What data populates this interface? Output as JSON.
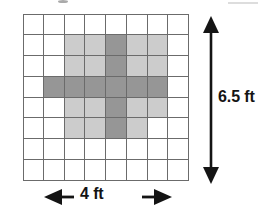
{
  "figure": {
    "title": "",
    "type": "shaded-grid-area-diagram"
  },
  "grid": {
    "columns": 8,
    "rows": 8,
    "line_color": "#6b6b6b",
    "background_color": "#ffffff",
    "shade_colors": {
      "none": "#ffffff",
      "light": "#cccccc",
      "dark": "#969696"
    },
    "legend": {
      "none_label": "unshaded",
      "light_label": "light shaded",
      "dark_label": "dark shaded"
    },
    "cells": [
      [
        "none",
        "none",
        "none",
        "none",
        "none",
        "none",
        "none",
        "none"
      ],
      [
        "none",
        "none",
        "light",
        "light",
        "dark",
        "light",
        "light",
        "none"
      ],
      [
        "none",
        "none",
        "light",
        "light",
        "dark",
        "light",
        "light",
        "none"
      ],
      [
        "none",
        "dark",
        "dark",
        "dark",
        "dark",
        "dark",
        "dark",
        "none"
      ],
      [
        "none",
        "none",
        "light",
        "light",
        "dark",
        "light",
        "light",
        "none"
      ],
      [
        "none",
        "none",
        "light",
        "light",
        "dark",
        "light",
        "none",
        "none"
      ],
      [
        "none",
        "none",
        "none",
        "none",
        "none",
        "none",
        "none",
        "none"
      ],
      [
        "none",
        "none",
        "none",
        "none",
        "none",
        "none",
        "none",
        "none"
      ]
    ]
  },
  "dimensions": {
    "vertical": {
      "label": "6.5 ft",
      "value": 6.5,
      "unit": "ft",
      "arrow_style": "double-headed",
      "orientation": "vertical",
      "position": "right"
    },
    "horizontal": {
      "label": "4 ft",
      "value": 4,
      "unit": "ft",
      "arrow_style": "double-headed",
      "orientation": "horizontal",
      "position": "bottom"
    }
  },
  "icons": {
    "arrow_up": "arrow-up-icon",
    "arrow_down": "arrow-down-icon",
    "arrow_left": "arrow-left-icon",
    "arrow_right": "arrow-right-icon"
  }
}
